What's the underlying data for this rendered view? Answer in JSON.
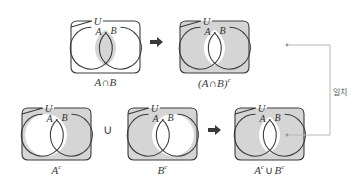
{
  "figure": {
    "colors": {
      "shade": "#d5d5d5",
      "stroke": "#3c3c3c",
      "white": "#ffffff",
      "text": "#333333",
      "connector": "#b8b8b8",
      "arrow": "#3a3a3a"
    },
    "universe_label": "U",
    "set_a_label": "A",
    "set_b_label": "B"
  },
  "panels": [
    {
      "id": "a-intersect-b",
      "caption": "A∩B",
      "universe_label": "U",
      "set_a_label": "A",
      "set_b_label": "B",
      "shaded_regions": [
        "intersection"
      ],
      "box_shaded": false
    },
    {
      "id": "a-intersect-b-complement",
      "caption": "(A∩B)",
      "caption_sup": "c",
      "universe_label": "U",
      "set_a_label": "A",
      "set_b_label": "B",
      "shaded_regions": [
        "universe-minus-intersection"
      ],
      "box_shaded": true
    },
    {
      "id": "a-complement",
      "caption": "A",
      "caption_sup": "c",
      "universe_label": "U",
      "set_a_label": "A",
      "set_b_label": "B",
      "shaded_regions": [
        "universe-minus-a"
      ],
      "box_shaded": true
    },
    {
      "id": "b-complement",
      "caption": "B",
      "caption_sup": "c",
      "universe_label": "U",
      "set_a_label": "A",
      "set_b_label": "B",
      "shaded_regions": [
        "universe-minus-b"
      ],
      "box_shaded": true
    },
    {
      "id": "a-complement-union-b-complement",
      "caption_a": "A",
      "caption_a_sup": "c",
      "caption_union": "∪",
      "caption_b": "B",
      "caption_b_sup": "c",
      "universe_label": "U",
      "set_a_label": "A",
      "set_b_label": "B",
      "shaded_regions": [
        "universe-minus-intersection"
      ],
      "box_shaded": true
    }
  ],
  "operators": {
    "arrow_top": "➡",
    "union_bottom": "∪",
    "arrow_bottom": "➡"
  },
  "annotation": {
    "match_label": "일치"
  }
}
